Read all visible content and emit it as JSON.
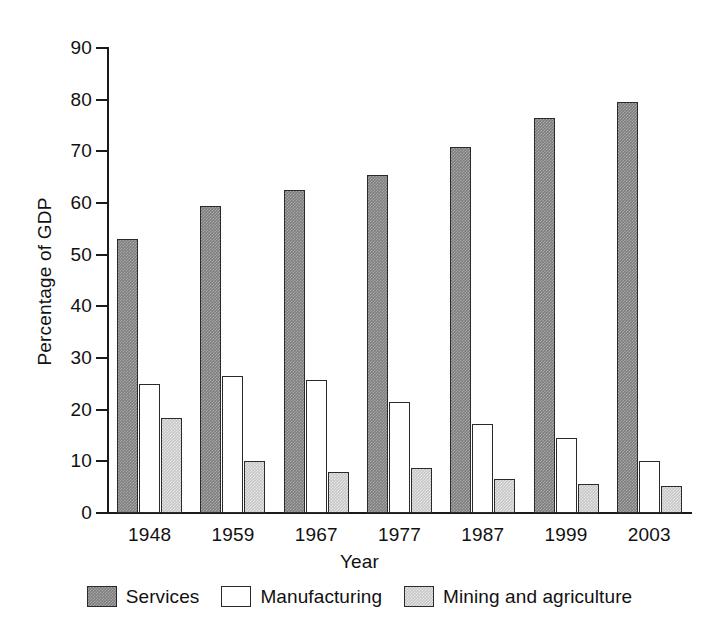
{
  "chart_data": {
    "type": "bar",
    "title": "",
    "xlabel": "Year",
    "ylabel": "Percentage of GDP",
    "ylim": [
      0,
      90
    ],
    "y_ticks": [
      0,
      10,
      20,
      30,
      40,
      50,
      60,
      70,
      80,
      90
    ],
    "grid": false,
    "legend_position": "bottom",
    "categories": [
      "1948",
      "1959",
      "1967",
      "1977",
      "1987",
      "1999",
      "2003"
    ],
    "series": [
      {
        "name": "Services",
        "color": "#7d7d7d",
        "values": [
          53,
          59.5,
          62.5,
          65.5,
          70.8,
          76.5,
          79.5
        ]
      },
      {
        "name": "Manufacturing",
        "color": "#ffffff",
        "values": [
          25,
          26.5,
          25.8,
          21.5,
          17.3,
          14.5,
          10
        ]
      },
      {
        "name": "Mining and agriculture",
        "color": "#c6c6c6",
        "values": [
          18.3,
          10,
          8,
          8.7,
          6.5,
          5.7,
          5.2
        ]
      }
    ]
  },
  "legend": {
    "items": [
      {
        "label": "Services",
        "swatch": "services"
      },
      {
        "label": "Manufacturing",
        "swatch": "manufacturing"
      },
      {
        "label": "Mining and agriculture",
        "swatch": "mining"
      }
    ]
  }
}
